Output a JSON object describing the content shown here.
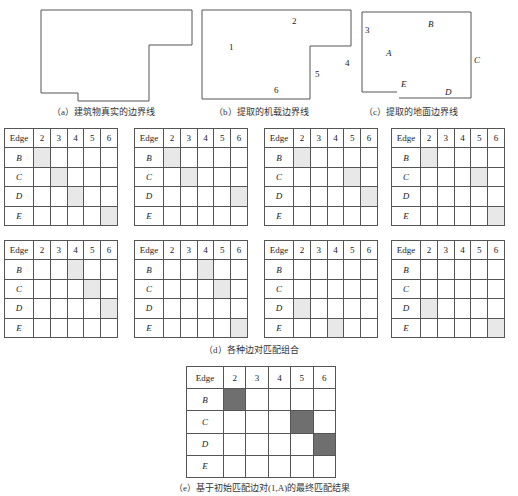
{
  "figure": {
    "panels": [
      {
        "id": "a",
        "caption": "（a）建筑物真实的边界线",
        "labels": []
      },
      {
        "id": "b",
        "caption": "（b）提取的机载边界线",
        "labels": [
          "1",
          "2",
          "4",
          "5",
          "6"
        ]
      },
      {
        "id": "c",
        "caption": "（c）提取的地面边界线",
        "labels": [
          "3",
          "A",
          "B",
          "C",
          "D",
          "E"
        ]
      }
    ],
    "panel_b_labels": {
      "e1": "1",
      "e2": "2",
      "e4": "4",
      "e5": "5",
      "e6": "6"
    },
    "panel_c_labels": {
      "e3": "3",
      "eA": "A",
      "eB": "B",
      "eC": "C",
      "eD": "D",
      "eE": "E"
    },
    "grid_header": {
      "corner": "Edge",
      "cols": [
        "2",
        "3",
        "4",
        "5",
        "6"
      ],
      "rows": [
        "B",
        "C",
        "D",
        "E"
      ]
    },
    "combinations": [
      {
        "matches": [
          [
            "B",
            "2"
          ],
          [
            "C",
            "3"
          ],
          [
            "D",
            "4"
          ],
          [
            "E",
            "6"
          ]
        ]
      },
      {
        "matches": [
          [
            "B",
            "2"
          ],
          [
            "C",
            "3"
          ],
          [
            "D",
            "6"
          ]
        ]
      },
      {
        "matches": [
          [
            "B",
            "2"
          ],
          [
            "C",
            "5"
          ],
          [
            "D",
            "6"
          ]
        ]
      },
      {
        "matches": [
          [
            "B",
            "2"
          ],
          [
            "C",
            "5"
          ],
          [
            "E",
            "6"
          ]
        ]
      },
      {
        "matches": [
          [
            "B",
            "4"
          ],
          [
            "C",
            "5"
          ],
          [
            "D",
            "6"
          ]
        ]
      },
      {
        "matches": [
          [
            "B",
            "4"
          ],
          [
            "C",
            "5"
          ],
          [
            "E",
            "6"
          ]
        ]
      },
      {
        "matches": [
          [
            "D",
            "2"
          ],
          [
            "E",
            "4"
          ]
        ]
      },
      {
        "matches": [
          [
            "D",
            "2"
          ],
          [
            "E",
            "6"
          ]
        ]
      }
    ],
    "combinations_caption": "（d）各种边对匹配组合",
    "final": {
      "matches": [
        [
          "B",
          "2"
        ],
        [
          "C",
          "5"
        ],
        [
          "D",
          "6"
        ]
      ],
      "caption": "（e）基于初始匹配边对(1,A)的最终匹配结果"
    },
    "colors": {
      "candidate_fill": "#e8e8e8",
      "final_fill": "#6f6f6f",
      "line": "#555555"
    }
  }
}
